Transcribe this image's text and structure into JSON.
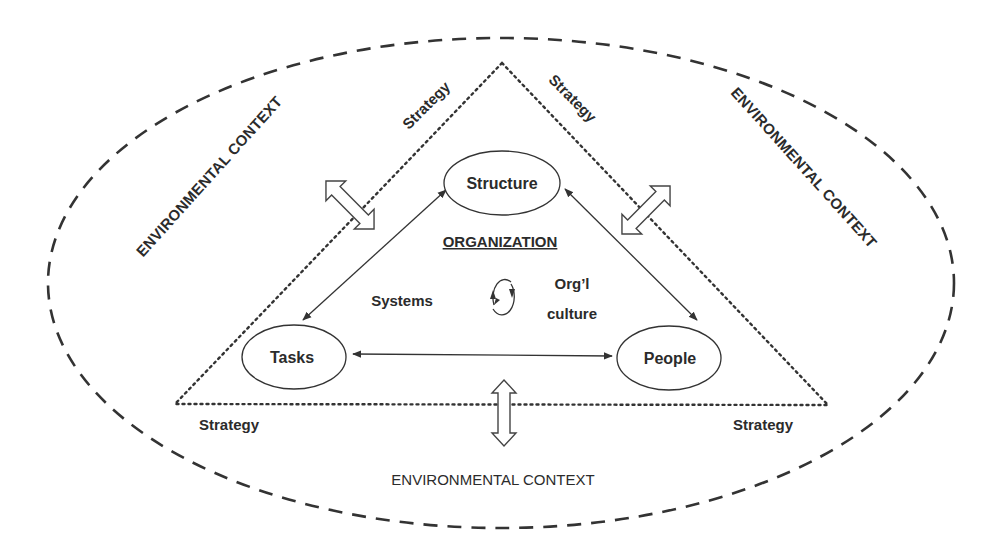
{
  "diagram": {
    "type": "organizational-model",
    "environment": {
      "label_top_left": "ENVIRONMENTAL CONTEXT",
      "label_top_right": "ENVIRONMENTAL CONTEXT",
      "label_bottom": "ENVIRONMENTAL CONTEXT",
      "border_style": "dashed"
    },
    "strategy": {
      "label_left_side": "Strategy",
      "label_right_side": "Strategy",
      "label_bottom_left": "Strategy",
      "label_bottom_right": "Strategy",
      "border_style": "dotted"
    },
    "organization": {
      "title": "ORGANIZATION",
      "nodes": {
        "structure": "Structure",
        "tasks": "Tasks",
        "people": "People"
      },
      "center": {
        "systems": "Systems",
        "culture_line1": "Org’l",
        "culture_line2": "culture"
      }
    },
    "edges": [
      {
        "from": "Structure",
        "to": "Tasks",
        "type": "bidirectional"
      },
      {
        "from": "Structure",
        "to": "People",
        "type": "bidirectional"
      },
      {
        "from": "Tasks",
        "to": "People",
        "type": "bidirectional"
      },
      {
        "from": "Systems",
        "to": "Org’l culture",
        "type": "cycle"
      }
    ],
    "environment_interactions": [
      {
        "side": "left",
        "icon": "double-arrow-icon"
      },
      {
        "side": "right",
        "icon": "double-arrow-icon"
      },
      {
        "side": "bottom",
        "icon": "double-arrow-icon"
      }
    ],
    "colors": {
      "line": "#333333",
      "text": "#2b2b2b",
      "background": "#ffffff"
    }
  }
}
